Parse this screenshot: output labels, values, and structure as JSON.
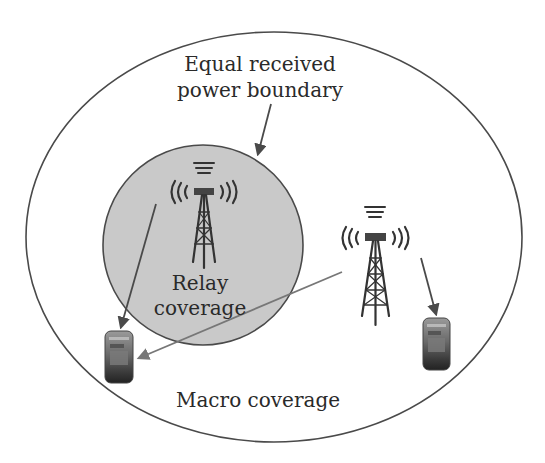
{
  "diagram": {
    "boundary_label": {
      "line1": "Equal received",
      "line2": "power boundary"
    },
    "relay": {
      "label_line1": "Relay",
      "label_line2": "coverage",
      "fill_color": "#c8c8c8"
    },
    "macro": {
      "label": "Macro coverage"
    },
    "colors": {
      "line": "#4a4a4a",
      "relay_fill": "#c9c9c9",
      "background": "#ffffff"
    },
    "elements": {
      "towers": [
        "relay-tower",
        "macro-tower"
      ],
      "user_equipment": [
        "relay-ue",
        "macro-ue"
      ],
      "links": [
        "relay-to-relay-ue",
        "macro-to-relay-ue",
        "macro-to-macro-ue",
        "label-to-boundary"
      ]
    }
  }
}
